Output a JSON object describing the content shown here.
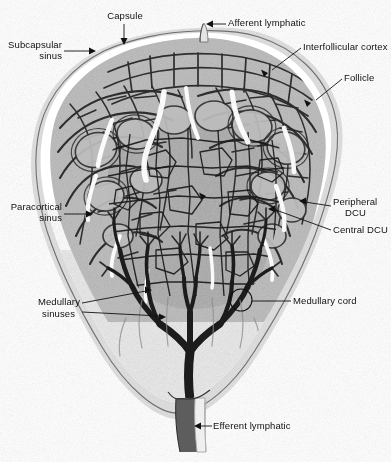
{
  "figure": {
    "type": "anatomical-histology-illustration",
    "background_color": "#ffffff",
    "ink_color": "#111111",
    "width": 391,
    "height": 462
  },
  "labels": {
    "capsule": "Capsule",
    "afferent_lymphatic": "Afferent lymphatic",
    "subcapsular_sinus_line1": "Subcapsular",
    "subcapsular_sinus_line2": "sinus",
    "interfollicular_cortex": "Interfollicular cortex",
    "follicle": "Follicle",
    "paracortical_sinus_line1": "Paracortical",
    "paracortical_sinus_line2": "sinus",
    "peripheral_dcu_line1": "Peripheral",
    "peripheral_dcu_line2": "DCU",
    "central_dcu": "Central DCU",
    "medullary_sinuses_line1": "Medullary",
    "medullary_sinuses_line2": "sinuses",
    "medullary_cord": "Medullary cord",
    "efferent_lymphatic": "Efferent lymphatic"
  },
  "regions": {
    "capsule": "capsule-outline",
    "cortex": "cortex-follicle-band",
    "paracortex": "deep-cortical-units",
    "medulla": "medullary-sinus-network",
    "hilum": "efferent-stem"
  }
}
